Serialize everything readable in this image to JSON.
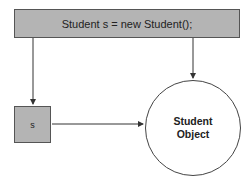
{
  "statement": {
    "text": "Student s = new Student();"
  },
  "variable": {
    "label": "s"
  },
  "object": {
    "line1": "Student",
    "line2": "Object"
  },
  "colors": {
    "box_fill": "#b4b4b4",
    "stroke": "#444444",
    "background": "#ffffff"
  }
}
